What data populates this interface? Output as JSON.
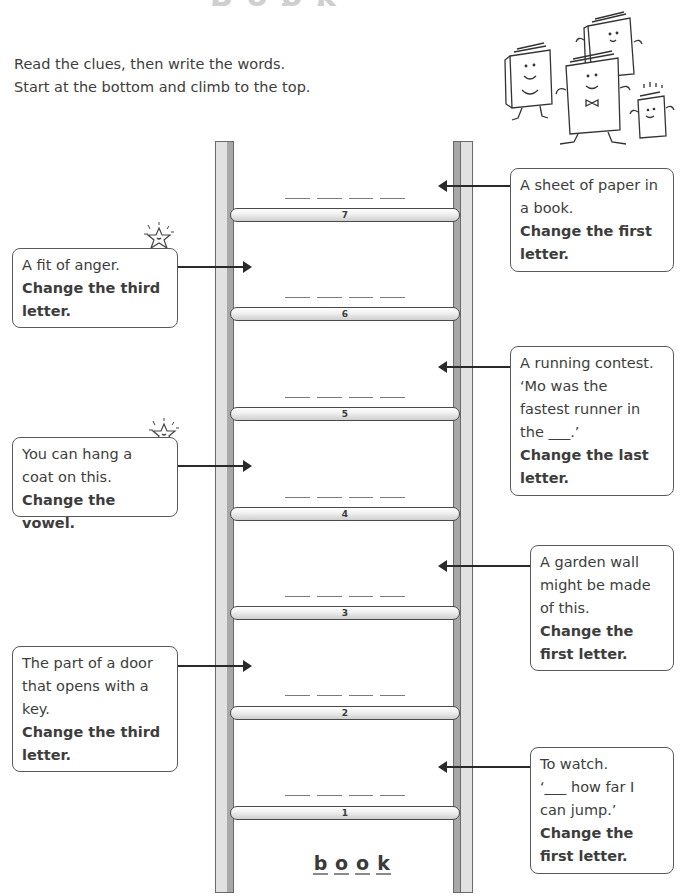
{
  "title_fragment": "Book ladder",
  "instructions": {
    "line1": "Read the clues, then write the words.",
    "line2": "Start at the bottom and climb to the top."
  },
  "ladder": {
    "start_word": [
      "b",
      "o",
      "o",
      "k"
    ],
    "rungs": [
      {
        "number": "7",
        "blanks": 4
      },
      {
        "number": "6",
        "blanks": 4
      },
      {
        "number": "5",
        "blanks": 4
      },
      {
        "number": "4",
        "blanks": 4
      },
      {
        "number": "3",
        "blanks": 4
      },
      {
        "number": "2",
        "blanks": 4
      },
      {
        "number": "1",
        "blanks": 4
      }
    ]
  },
  "clues": {
    "rung7": {
      "lines": [
        "A sheet of paper in",
        "a book."
      ],
      "instruction": "Change the first letter.",
      "side": "right"
    },
    "rung6": {
      "lines": [
        "A fit of anger."
      ],
      "instruction": "Change the third letter.",
      "side": "left"
    },
    "rung5": {
      "lines": [
        "A running contest.",
        "‘Mo was the",
        "fastest runner in",
        "the ___.’"
      ],
      "instruction": "Change the last letter.",
      "side": "right"
    },
    "rung4": {
      "lines": [
        "You can hang a",
        "coat on this."
      ],
      "instruction": "Change the vowel.",
      "side": "left"
    },
    "rung3": {
      "lines": [
        "A garden wall",
        "might be made",
        "of this."
      ],
      "instruction": "Change the first letter.",
      "side": "right"
    },
    "rung2": {
      "lines": [
        "The part of a door",
        "that opens with a",
        "key."
      ],
      "instruction": "Change the third letter.",
      "side": "left"
    },
    "rung1": {
      "lines": [
        "To watch.",
        "‘___ how far I",
        "can jump.’"
      ],
      "instruction": "Change the first letter.",
      "side": "right"
    }
  },
  "colors": {
    "text": "#3d3d3d",
    "border": "#5a5a5a",
    "rail_face": "#e1e1e1",
    "rail_side": "#a8a8a8",
    "arrow": "#2a2a2a"
  },
  "icons": {
    "star_decoration": "smiling-star-icon",
    "books_illustration": "cartoon-books-icon"
  }
}
